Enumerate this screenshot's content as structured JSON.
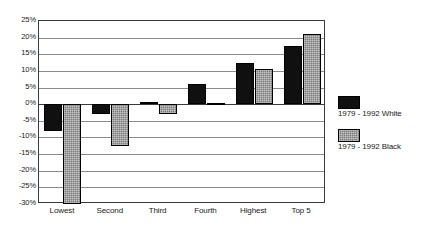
{
  "chart_data": {
    "type": "bar",
    "title": "",
    "subtitle": "",
    "xlabel": "",
    "ylabel": "",
    "categories": [
      "Lowest",
      "Second",
      "Third",
      "Fourth",
      "Highest",
      "Top 5"
    ],
    "series": [
      {
        "name": "1979 - 1992 White",
        "color": "#101010",
        "values": [
          -8,
          -3,
          0.6,
          6,
          12.5,
          17.5
        ]
      },
      {
        "name": "1979 - 1992 Black",
        "color": "#7d7d7d",
        "values": [
          -30,
          -12.5,
          -3,
          0.3,
          10.5,
          21
        ]
      }
    ],
    "ylim": [
      -30,
      25
    ],
    "ytick_step": 5,
    "ytick_labels": [
      "25%",
      "20%",
      "15%",
      "10%",
      "5%",
      "0%",
      "-5%",
      "-10%",
      "-15%",
      "-20%",
      "-25%",
      "-30%"
    ],
    "ytick_values": [
      25,
      20,
      15,
      10,
      5,
      0,
      -5,
      -10,
      -15,
      -20,
      -25,
      -30
    ],
    "grid": true,
    "grid_axis": "y",
    "legend_position": "right",
    "zero_line": 0
  },
  "legend": {
    "entries": [
      {
        "label": "1979 - 1992 White",
        "swatch": "white-series"
      },
      {
        "label": "1979 - 1992 Black",
        "swatch": "black-series"
      }
    ]
  }
}
